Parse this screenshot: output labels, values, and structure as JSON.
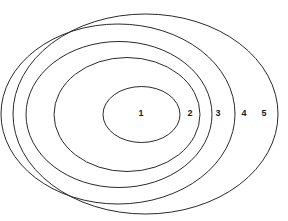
{
  "figure": {
    "background_color": "#ffffff",
    "stroke_color": "#2b2b2b",
    "label_color": "#1a1a1a",
    "width": 288,
    "height": 221
  },
  "chart_data": {
    "type": "diagram",
    "subtype": "nested-ellipses",
    "title": "",
    "xlabel": "",
    "ylabel": "",
    "grid": false,
    "legend": false,
    "zone_count": 5,
    "labels": [
      "1",
      "2",
      "3",
      "4",
      "5"
    ],
    "zones": [
      {
        "label": "1",
        "ring_index": 1,
        "cx": 141.5,
        "cy": 114.5,
        "rx": 38.5,
        "ry": 28.0,
        "label_x": 141,
        "label_y": 114
      },
      {
        "label": "2",
        "ring_index": 2,
        "cx": 127.0,
        "cy": 114.5,
        "rx": 73.0,
        "ry": 57.0,
        "label_x": 190,
        "label_y": 114
      },
      {
        "label": "3",
        "ring_index": 3,
        "cx": 119.0,
        "cy": 114.5,
        "rx": 93.0,
        "ry": 73.0,
        "label_x": 218,
        "label_y": 114
      },
      {
        "label": "4",
        "ring_index": 4,
        "cx": 118.0,
        "cy": 114.0,
        "rx": 117.0,
        "ry": 90.0,
        "label_x": 244,
        "label_y": 114
      },
      {
        "label": "5",
        "ring_index": 5,
        "cx": 145.5,
        "cy": 114.0,
        "rx": 132.5,
        "ry": 100.0,
        "label_x": 264,
        "label_y": 114
      }
    ]
  }
}
